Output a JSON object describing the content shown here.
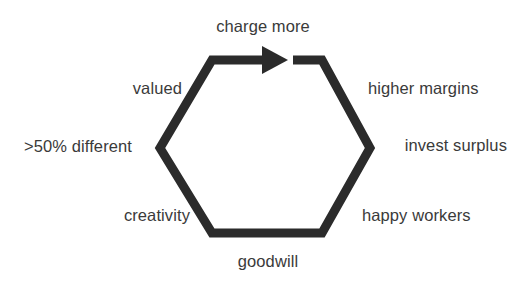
{
  "diagram": {
    "type": "cycle-hexagon",
    "stroke_color": "#2b2b2b",
    "text_color": "#3a3a3a",
    "background_color": "#ffffff",
    "stroke_width": 9,
    "direction": "clockwise",
    "nodes": [
      {
        "id": "charge-more",
        "label": "charge more",
        "position": "top"
      },
      {
        "id": "higher-margins",
        "label": "higher margins",
        "position": "upper-right"
      },
      {
        "id": "invest-surplus",
        "label": "invest surplus",
        "position": "right"
      },
      {
        "id": "happy-workers",
        "label": "happy workers",
        "position": "lower-right"
      },
      {
        "id": "goodwill",
        "label": "goodwill",
        "position": "bottom"
      },
      {
        "id": "creativity",
        "label": "creativity",
        "position": "lower-left"
      },
      {
        "id": "different",
        "label": ">50% different",
        "position": "left"
      },
      {
        "id": "valued",
        "label": "valued",
        "position": "upper-left"
      }
    ],
    "arrow": {
      "name": "clockwise-arrow-head",
      "points_to": "charge more",
      "direction": "right"
    }
  }
}
